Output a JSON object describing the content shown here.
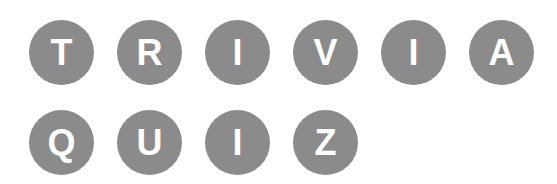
{
  "rows": [
    {
      "word": "TRIVIA",
      "letters": [
        "T",
        "R",
        "I",
        "V",
        "I",
        "A"
      ]
    },
    {
      "word": "QUIZ",
      "letters": [
        "Q",
        "U",
        "I",
        "Z"
      ]
    }
  ],
  "colors": {
    "tile_fill": "#8b8b8b",
    "letter": "#ffffff",
    "background": "#ffffff"
  }
}
